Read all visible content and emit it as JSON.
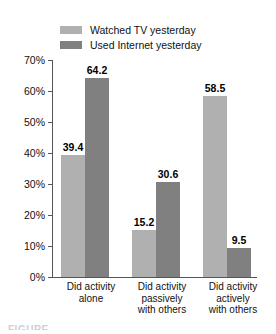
{
  "chart_data": {
    "type": "bar",
    "title": "",
    "xlabel": "",
    "ylabel": "",
    "categories": [
      "Did activity alone",
      "Did activity passively with others",
      "Did activity actively with others"
    ],
    "category_lines": [
      [
        "Did activity",
        "alone"
      ],
      [
        "Did activity",
        "passively",
        "with others"
      ],
      [
        "Did activity",
        "actively",
        "with others"
      ]
    ],
    "series": [
      {
        "name": "Watched TV yesterday",
        "color": "#b0b0b0",
        "values": [
          39.4,
          15.2,
          58.5
        ],
        "labels": [
          "39.4",
          "15.2",
          "58.5"
        ]
      },
      {
        "name": "Used Internet yesterday",
        "color": "#808080",
        "values": [
          64.2,
          30.6,
          9.5
        ],
        "labels": [
          "64.2",
          "30.6",
          "9.5"
        ]
      }
    ],
    "ylim": [
      0,
      70
    ],
    "ytick_values": [
      0,
      10,
      20,
      30,
      40,
      50,
      60,
      70
    ],
    "ytick_labels": [
      "0%",
      "10%",
      "20%",
      "30%",
      "40%",
      "50%",
      "60%",
      "70%"
    ],
    "grid": false,
    "legend_position": "top-center",
    "axis_color": "#555555"
  },
  "legend": {
    "items": [
      {
        "label": "Watched TV yesterday",
        "color": "#b0b0b0"
      },
      {
        "label": "Used Internet yesterday",
        "color": "#808080"
      }
    ]
  },
  "caption": {
    "cropped_text": "FIGURE"
  }
}
